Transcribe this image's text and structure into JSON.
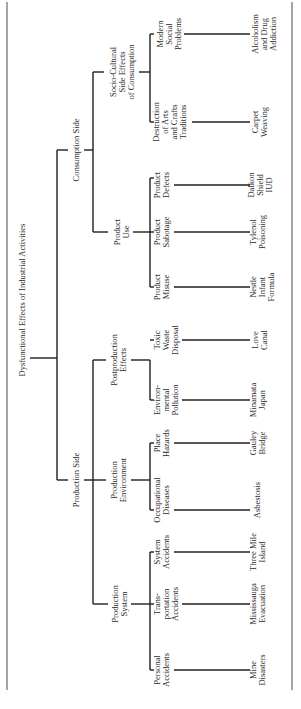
{
  "title": "Dysfunctional Effects of Industrial Activities",
  "tree": {
    "root": "Dysfunctional Effects of Industrial Activities",
    "consumption": {
      "label": "Consumption Side",
      "socio_cultural": {
        "label": [
          "Socio-Cultural",
          "Side Effects",
          "of Consumption"
        ],
        "destruction": {
          "label": [
            "Destruction",
            "of Arts",
            "and Crafts",
            "Traditions"
          ],
          "example": [
            "Carpet",
            "Weaving"
          ]
        },
        "modern": {
          "label": [
            "Modern",
            "Social",
            "Problems"
          ],
          "example": [
            "Alcoholism",
            "and Drug",
            "Addiction"
          ]
        }
      },
      "product_use": {
        "label": [
          "Product",
          "Use"
        ],
        "misuse": {
          "label": [
            "Product",
            "Misuse"
          ],
          "example": [
            "Nestle",
            "Infant",
            "Formula"
          ]
        },
        "sabotage": {
          "label": [
            "Product",
            "Sabotage"
          ],
          "example": [
            "Tylenol",
            "Poisoning"
          ]
        },
        "defects": {
          "label": [
            "Product",
            "Defects"
          ],
          "example": [
            "Dalkon",
            "Shield",
            "IUD"
          ]
        }
      }
    },
    "production": {
      "label": "Production Side",
      "system": {
        "label": [
          "Production",
          "System"
        ],
        "personal": {
          "label": [
            "Personal",
            "Accidents"
          ],
          "example": [
            "Mine",
            "Disasters"
          ]
        },
        "transportation": {
          "label": [
            "Trans-",
            "portation",
            "Accidents"
          ],
          "example": [
            "Mississauga",
            "Evacuation"
          ]
        },
        "system_acc": {
          "label": [
            "System",
            "Accidents"
          ],
          "example": [
            "Three Mile",
            "Island"
          ]
        }
      },
      "environment": {
        "label": [
          "Production",
          "Environment"
        ],
        "occupational": {
          "label": [
            "Occupational",
            "Diseases"
          ],
          "example": [
            "Asbestosis"
          ]
        },
        "place": {
          "label": [
            "Place",
            "Hazards"
          ],
          "example": [
            "Gauley",
            "Bridge"
          ]
        }
      },
      "postproduction": {
        "label": [
          "Postproduction",
          "Effects"
        ],
        "environmental": {
          "label": [
            "Environ-",
            "mental",
            "Pollution"
          ],
          "example": [
            "Minamata",
            "Japan"
          ]
        },
        "toxic": {
          "label": [
            "Toxic",
            "Waste",
            "Disposal"
          ],
          "example": [
            "Love",
            "Canal"
          ]
        }
      }
    }
  }
}
